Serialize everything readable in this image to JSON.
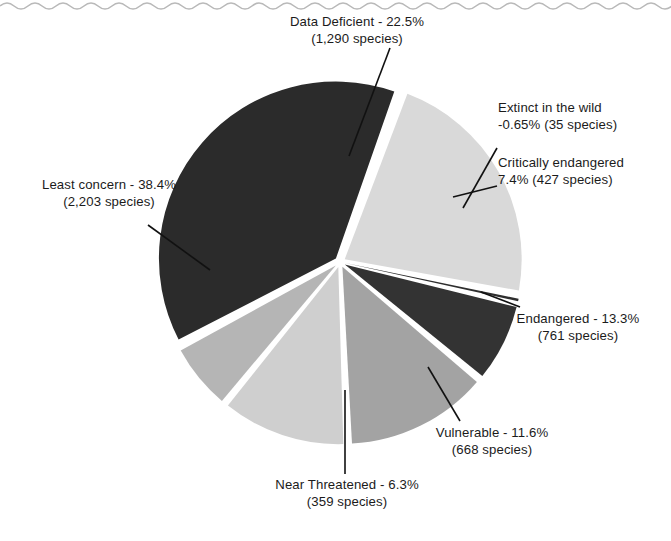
{
  "figure": {
    "decoration": "wavy-rule-top",
    "background_color": "#ffffff"
  },
  "chart_data": {
    "type": "pie",
    "title": "",
    "subtitle": "",
    "xlabel": "",
    "ylabel": "",
    "legend_position": "none",
    "labels_position": "outside-with-leader-lines",
    "grid": false,
    "exploded": true,
    "categories": [
      "Data Deficient",
      "Extinct in the wild",
      "Critically endangered",
      "Endangered",
      "Vulnerable",
      "Near Threatened",
      "Least concern"
    ],
    "values": [
      22.5,
      0.65,
      7.4,
      13.3,
      11.6,
      6.3,
      38.4
    ],
    "counts": [
      1290,
      35,
      427,
      761,
      668,
      359,
      2203
    ],
    "value_unit": "percent",
    "count_unit": "species",
    "colors": [
      "#d9d9d9",
      "#2e2e2e",
      "#333333",
      "#a3a3a3",
      "#cfcfcf",
      "#b5b5b5",
      "#2b2b2b"
    ],
    "slices": [
      {
        "name": "data-deficient",
        "line1": "Data Deficient - 22.5%",
        "line2": "(1,290 species)",
        "percent": 22.5,
        "count": 1290,
        "color": "#d9d9d9"
      },
      {
        "name": "extinct-in-the-wild",
        "line1": "Extinct in the wild",
        "line2": "-0.65% (35 species)",
        "percent": 0.65,
        "count": 35,
        "color": "#2e2e2e"
      },
      {
        "name": "critically-endangered",
        "line1": "Critically endangered",
        "line2": "7.4% (427 species)",
        "percent": 7.4,
        "count": 427,
        "color": "#333333"
      },
      {
        "name": "endangered",
        "line1": "Endangered - 13.3%",
        "line2": "(761 species)",
        "percent": 13.3,
        "count": 761,
        "color": "#a3a3a3"
      },
      {
        "name": "vulnerable",
        "line1": "Vulnerable - 11.6%",
        "line2": "(668 species)",
        "percent": 11.6,
        "count": 668,
        "color": "#cfcfcf"
      },
      {
        "name": "near-threatened",
        "line1": "Near Threatened - 6.3%",
        "line2": "(359 species)",
        "percent": 6.3,
        "count": 359,
        "color": "#b5b5b5"
      },
      {
        "name": "least-concern",
        "line1": "Least concern - 38.4%",
        "line2": "(2,203 species)",
        "percent": 38.4,
        "count": 2203,
        "color": "#2b2b2b"
      }
    ]
  }
}
